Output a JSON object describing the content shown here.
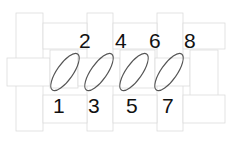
{
  "diagram": {
    "colors": {
      "rect_stroke": "#dcdcdc",
      "ellipse_stroke": "#555555",
      "text": "#111111"
    },
    "rects": [
      {
        "x": 16,
        "y": 13,
        "w": 27,
        "h": 118
      },
      {
        "x": 87,
        "y": 13,
        "w": 26,
        "h": 118
      },
      {
        "x": 157,
        "y": 13,
        "w": 26,
        "h": 118
      },
      {
        "x": 43,
        "y": 23,
        "w": 44,
        "h": 26
      },
      {
        "x": 113,
        "y": 23,
        "w": 44,
        "h": 26
      },
      {
        "x": 183,
        "y": 23,
        "w": 42,
        "h": 26
      },
      {
        "x": 7,
        "y": 58,
        "w": 43,
        "h": 28
      },
      {
        "x": 50,
        "y": 50,
        "w": 28,
        "h": 38
      },
      {
        "x": 78,
        "y": 58,
        "w": 42,
        "h": 28
      },
      {
        "x": 120,
        "y": 50,
        "w": 35,
        "h": 38
      },
      {
        "x": 155,
        "y": 58,
        "w": 35,
        "h": 28
      },
      {
        "x": 190,
        "y": 50,
        "w": 28,
        "h": 50
      },
      {
        "x": 43,
        "y": 95,
        "w": 44,
        "h": 28
      },
      {
        "x": 113,
        "y": 95,
        "w": 44,
        "h": 28
      },
      {
        "x": 183,
        "y": 95,
        "w": 42,
        "h": 28
      }
    ],
    "ellipses": [
      {
        "cx": 65,
        "cy": 72,
        "rx": 22,
        "ry": 8,
        "angle": -55
      },
      {
        "cx": 99,
        "cy": 72,
        "rx": 22,
        "ry": 8,
        "angle": -55
      },
      {
        "cx": 134,
        "cy": 72,
        "rx": 22,
        "ry": 8,
        "angle": -55
      },
      {
        "cx": 169,
        "cy": 72,
        "rx": 22,
        "ry": 8,
        "angle": -55
      }
    ],
    "labels_top": [
      {
        "text": "2",
        "x": 79,
        "y": 48
      },
      {
        "text": "4",
        "x": 115,
        "y": 48
      },
      {
        "text": "6",
        "x": 149,
        "y": 48
      },
      {
        "text": "8",
        "x": 184,
        "y": 48
      }
    ],
    "labels_bottom": [
      {
        "text": "1",
        "x": 53,
        "y": 113
      },
      {
        "text": "3",
        "x": 88,
        "y": 113
      },
      {
        "text": "5",
        "x": 126,
        "y": 113
      },
      {
        "text": "7",
        "x": 162,
        "y": 113
      }
    ]
  }
}
